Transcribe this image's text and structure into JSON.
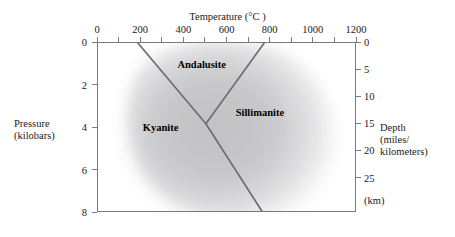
{
  "figure": {
    "type": "phase-diagram"
  },
  "top_axis": {
    "title": "Temperature (°C )",
    "unit": "°C",
    "min": 0,
    "max": 1200,
    "labels": [
      "0",
      "200",
      "400",
      "600",
      "800",
      "1000",
      "1200"
    ],
    "label_values": [
      0,
      200,
      400,
      600,
      800,
      1000,
      1200
    ],
    "tick_values": [
      0,
      100,
      200,
      300,
      400,
      500,
      600,
      700,
      800,
      900,
      1000,
      1100,
      1200
    ]
  },
  "left_axis": {
    "title_line1": "Pressure",
    "title_line2": "(kilobars)",
    "unit": "kilobars",
    "min": 0,
    "max": 8,
    "labels": [
      "0",
      "2",
      "4",
      "6",
      "8"
    ],
    "label_values": [
      0,
      2,
      4,
      6,
      8
    ]
  },
  "right_axis_miles": {
    "unit_note": "(mi)",
    "labels": [
      "5",
      "10",
      "15"
    ],
    "label_values": [
      5,
      10,
      15
    ],
    "pressure_at_label": [
      2.05,
      4.1,
      6.15
    ]
  },
  "right_axis_km": {
    "unit_note": "(km)",
    "title_line1": "Depth",
    "title_line2": "(miles/",
    "title_line3": "kilometers)",
    "labels": [
      "0",
      "5",
      "10",
      "15",
      "20",
      "25"
    ],
    "label_values": [
      0,
      5,
      10,
      15,
      20,
      25
    ],
    "pressure_at_label": [
      0,
      1.28,
      2.55,
      3.83,
      5.1,
      6.38
    ]
  },
  "phases": [
    {
      "name": "Andalusite",
      "label_temp_c": 480,
      "label_pressure_kb": 1.3,
      "description": "low-pressure, intermediate-temperature polymorph"
    },
    {
      "name": "Kyanite",
      "label_temp_c": 290,
      "label_pressure_kb": 4.25,
      "description": "high-pressure, low-temperature polymorph"
    },
    {
      "name": "Sillimanite",
      "label_temp_c": 750,
      "label_pressure_kb": 3.55,
      "description": "high-temperature polymorph"
    }
  ],
  "chart_data": {
    "type": "line",
    "title": "Temperature (°C )",
    "xlabel": "Temperature (°C )",
    "ylabel": "Pressure (kilobars)",
    "xlim": [
      0,
      1200
    ],
    "ylim": [
      8,
      0
    ],
    "y_inverted": true,
    "grid": false,
    "legend": "none",
    "triple_point": {
      "temp_c": 500,
      "pressure_kb": 3.8
    },
    "series": [
      {
        "name": "Kyanite / Andalusite boundary",
        "x": [
          185,
          500
        ],
        "y": [
          0,
          3.8
        ]
      },
      {
        "name": "Andalusite / Sillimanite boundary",
        "x": [
          500,
          770
        ],
        "y": [
          3.8,
          0
        ]
      },
      {
        "name": "Kyanite / Sillimanite boundary",
        "x": [
          500,
          765
        ],
        "y": [
          3.8,
          8
        ]
      }
    ],
    "annotations": [
      "Andalusite",
      "Kyanite",
      "Sillimanite"
    ]
  },
  "colors": {
    "axis": "#7a7a7a",
    "boundary_line": "#6e6e72",
    "shading_core": "#c4c4c6",
    "shading_edge": "#ffffff",
    "text": "#1a1a1a",
    "background": "#ffffff"
  }
}
